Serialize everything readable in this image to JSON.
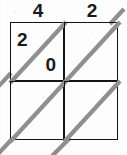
{
  "figure": {
    "kind": "lattice-multiplication-grid",
    "rows": 2,
    "columns": 2
  },
  "top_labels": [
    {
      "value": "4"
    },
    {
      "value": "2"
    }
  ],
  "cells": [
    {
      "row": 0,
      "column": 0,
      "upper_digit": "2",
      "lower_digit": "0"
    },
    {
      "row": 0,
      "column": 1,
      "upper_digit": "",
      "lower_digit": ""
    },
    {
      "row": 1,
      "column": 0,
      "upper_digit": "",
      "lower_digit": ""
    },
    {
      "row": 1,
      "column": 1,
      "upper_digit": "",
      "lower_digit": ""
    }
  ],
  "colors": {
    "grid_line": "#141414",
    "diagonal_line": "#8f8f8f",
    "digit": "#1a1a1a",
    "background": "#fdfdfd"
  }
}
